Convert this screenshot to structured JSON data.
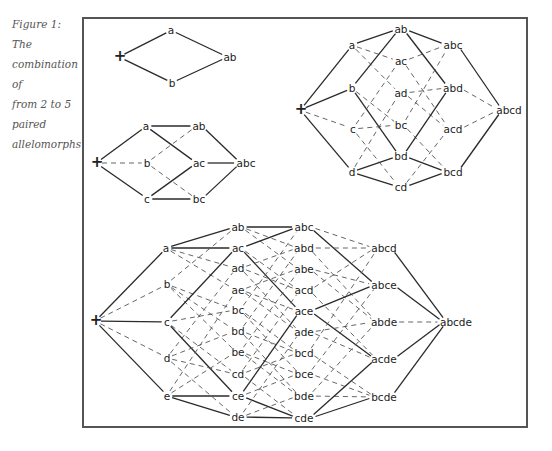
{
  "caption": {
    "line1": "Figure 1: The",
    "line2": "combination of",
    "line3": "from 2 to 5",
    "line4": "paired",
    "line5": "allelomorphs"
  },
  "colors": {
    "frame": "#555555",
    "text": "#222222",
    "caption": "#555555"
  },
  "diagrams": [
    {
      "id": "two-allele",
      "nodes": [
        {
          "id": "+",
          "x": 120,
          "y": 57
        },
        {
          "id": "a",
          "x": 171,
          "y": 30
        },
        {
          "id": "b",
          "x": 172,
          "y": 83
        },
        {
          "id": "ab",
          "x": 230,
          "y": 57
        }
      ],
      "edges": [
        [
          "+",
          "a",
          "s"
        ],
        [
          "+",
          "b",
          "s"
        ],
        [
          "a",
          "ab",
          "s"
        ],
        [
          "b",
          "ab",
          "s"
        ]
      ]
    },
    {
      "id": "three-allele",
      "nodes": [
        {
          "id": "+",
          "x": 97,
          "y": 163
        },
        {
          "id": "a",
          "x": 146,
          "y": 126
        },
        {
          "id": "b",
          "x": 147,
          "y": 163
        },
        {
          "id": "c",
          "x": 147,
          "y": 199
        },
        {
          "id": "ab",
          "x": 199,
          "y": 126
        },
        {
          "id": "ac",
          "x": 199,
          "y": 163
        },
        {
          "id": "bc",
          "x": 199,
          "y": 199
        },
        {
          "id": "abc",
          "x": 246,
          "y": 163
        }
      ],
      "edges": [
        [
          "+",
          "a",
          "s"
        ],
        [
          "+",
          "b",
          "d"
        ],
        [
          "+",
          "c",
          "s"
        ],
        [
          "a",
          "ab",
          "s"
        ],
        [
          "a",
          "ac",
          "s"
        ],
        [
          "b",
          "ab",
          "d"
        ],
        [
          "b",
          "bc",
          "d"
        ],
        [
          "c",
          "ac",
          "s"
        ],
        [
          "c",
          "bc",
          "s"
        ],
        [
          "ab",
          "abc",
          "s"
        ],
        [
          "ac",
          "abc",
          "s"
        ],
        [
          "bc",
          "abc",
          "s"
        ]
      ]
    },
    {
      "id": "four-allele",
      "nodes": [
        {
          "id": "+",
          "x": 301,
          "y": 110
        },
        {
          "id": "a",
          "x": 352,
          "y": 45
        },
        {
          "id": "b",
          "x": 352,
          "y": 88
        },
        {
          "id": "c",
          "x": 353,
          "y": 129
        },
        {
          "id": "d",
          "x": 352,
          "y": 172
        },
        {
          "id": "ab",
          "x": 401,
          "y": 29
        },
        {
          "id": "ac",
          "x": 401,
          "y": 61
        },
        {
          "id": "ad",
          "x": 401,
          "y": 93
        },
        {
          "id": "bc",
          "x": 401,
          "y": 125
        },
        {
          "id": "bd",
          "x": 401,
          "y": 156
        },
        {
          "id": "cd",
          "x": 401,
          "y": 187
        },
        {
          "id": "abc",
          "x": 453,
          "y": 45
        },
        {
          "id": "abd",
          "x": 453,
          "y": 88
        },
        {
          "id": "acd",
          "x": 453,
          "y": 129
        },
        {
          "id": "bcd",
          "x": 453,
          "y": 172
        },
        {
          "id": "abcd",
          "x": 509,
          "y": 110
        }
      ],
      "edges": [
        [
          "+",
          "a",
          "s"
        ],
        [
          "+",
          "b",
          "s"
        ],
        [
          "+",
          "c",
          "d"
        ],
        [
          "+",
          "d",
          "s"
        ],
        [
          "a",
          "ab",
          "s"
        ],
        [
          "a",
          "ac",
          "d"
        ],
        [
          "a",
          "ad",
          "d"
        ],
        [
          "b",
          "ab",
          "s"
        ],
        [
          "b",
          "bc",
          "d"
        ],
        [
          "b",
          "bd",
          "s"
        ],
        [
          "c",
          "ac",
          "d"
        ],
        [
          "c",
          "bc",
          "d"
        ],
        [
          "c",
          "cd",
          "d"
        ],
        [
          "d",
          "ad",
          "d"
        ],
        [
          "d",
          "bd",
          "s"
        ],
        [
          "d",
          "cd",
          "s"
        ],
        [
          "ab",
          "abc",
          "s"
        ],
        [
          "ab",
          "abd",
          "s"
        ],
        [
          "ac",
          "abc",
          "d"
        ],
        [
          "ac",
          "acd",
          "d"
        ],
        [
          "ad",
          "abd",
          "d"
        ],
        [
          "ad",
          "acd",
          "d"
        ],
        [
          "bc",
          "abc",
          "d"
        ],
        [
          "bc",
          "bcd",
          "d"
        ],
        [
          "bd",
          "abd",
          "s"
        ],
        [
          "bd",
          "bcd",
          "s"
        ],
        [
          "cd",
          "acd",
          "d"
        ],
        [
          "cd",
          "bcd",
          "s"
        ],
        [
          "abc",
          "abcd",
          "s"
        ],
        [
          "abd",
          "abcd",
          "d"
        ],
        [
          "acd",
          "abcd",
          "d"
        ],
        [
          "bcd",
          "abcd",
          "s"
        ]
      ]
    },
    {
      "id": "five-allele",
      "nodes": [
        {
          "id": "+",
          "x": 96,
          "y": 321
        },
        {
          "id": "a",
          "x": 166,
          "y": 248
        },
        {
          "id": "b",
          "x": 167,
          "y": 284
        },
        {
          "id": "c",
          "x": 167,
          "y": 322
        },
        {
          "id": "d",
          "x": 167,
          "y": 358
        },
        {
          "id": "e",
          "x": 167,
          "y": 396
        },
        {
          "id": "ab",
          "x": 238,
          "y": 227
        },
        {
          "id": "ac",
          "x": 238,
          "y": 248
        },
        {
          "id": "ad",
          "x": 238,
          "y": 268
        },
        {
          "id": "ae",
          "x": 238,
          "y": 290
        },
        {
          "id": "bc",
          "x": 238,
          "y": 310
        },
        {
          "id": "bd",
          "x": 238,
          "y": 331
        },
        {
          "id": "be",
          "x": 238,
          "y": 352
        },
        {
          "id": "cd",
          "x": 238,
          "y": 374
        },
        {
          "id": "ce",
          "x": 238,
          "y": 396
        },
        {
          "id": "de",
          "x": 238,
          "y": 417
        },
        {
          "id": "abc",
          "x": 304,
          "y": 227
        },
        {
          "id": "abd",
          "x": 304,
          "y": 248
        },
        {
          "id": "abe",
          "x": 304,
          "y": 269
        },
        {
          "id": "acd",
          "x": 304,
          "y": 290
        },
        {
          "id": "ace",
          "x": 304,
          "y": 311
        },
        {
          "id": "ade",
          "x": 304,
          "y": 332
        },
        {
          "id": "bcd",
          "x": 304,
          "y": 353
        },
        {
          "id": "bce",
          "x": 304,
          "y": 374
        },
        {
          "id": "bde",
          "x": 304,
          "y": 396
        },
        {
          "id": "cde",
          "x": 304,
          "y": 418
        },
        {
          "id": "abcd",
          "x": 384,
          "y": 248
        },
        {
          "id": "abce",
          "x": 384,
          "y": 285
        },
        {
          "id": "abde",
          "x": 384,
          "y": 322
        },
        {
          "id": "acde",
          "x": 384,
          "y": 359
        },
        {
          "id": "bcde",
          "x": 384,
          "y": 397
        },
        {
          "id": "abcde",
          "x": 456,
          "y": 322
        }
      ],
      "edges": [
        [
          "+",
          "a",
          "s"
        ],
        [
          "+",
          "b",
          "d"
        ],
        [
          "+",
          "c",
          "s"
        ],
        [
          "+",
          "d",
          "d"
        ],
        [
          "+",
          "e",
          "s"
        ],
        [
          "a",
          "ab",
          "s"
        ],
        [
          "a",
          "ac",
          "s"
        ],
        [
          "a",
          "ad",
          "d"
        ],
        [
          "a",
          "ae",
          "d"
        ],
        [
          "b",
          "ab",
          "d"
        ],
        [
          "b",
          "bc",
          "d"
        ],
        [
          "b",
          "bd",
          "d"
        ],
        [
          "b",
          "be",
          "d"
        ],
        [
          "c",
          "ac",
          "s"
        ],
        [
          "c",
          "bc",
          "d"
        ],
        [
          "c",
          "cd",
          "d"
        ],
        [
          "c",
          "ce",
          "s"
        ],
        [
          "d",
          "ad",
          "d"
        ],
        [
          "d",
          "bd",
          "d"
        ],
        [
          "d",
          "cd",
          "d"
        ],
        [
          "d",
          "de",
          "d"
        ],
        [
          "e",
          "ae",
          "d"
        ],
        [
          "e",
          "be",
          "d"
        ],
        [
          "e",
          "ce",
          "s"
        ],
        [
          "e",
          "de",
          "s"
        ],
        [
          "ab",
          "abc",
          "s"
        ],
        [
          "ab",
          "abd",
          "d"
        ],
        [
          "ab",
          "abe",
          "d"
        ],
        [
          "ac",
          "abc",
          "s"
        ],
        [
          "ac",
          "acd",
          "d"
        ],
        [
          "ac",
          "ace",
          "s"
        ],
        [
          "ad",
          "abd",
          "d"
        ],
        [
          "ad",
          "acd",
          "d"
        ],
        [
          "ad",
          "ade",
          "d"
        ],
        [
          "ae",
          "abe",
          "d"
        ],
        [
          "ae",
          "ace",
          "d"
        ],
        [
          "ae",
          "ade",
          "d"
        ],
        [
          "bc",
          "abc",
          "d"
        ],
        [
          "bc",
          "bcd",
          "d"
        ],
        [
          "bc",
          "bce",
          "d"
        ],
        [
          "bd",
          "abd",
          "d"
        ],
        [
          "bd",
          "bcd",
          "d"
        ],
        [
          "bd",
          "bde",
          "d"
        ],
        [
          "be",
          "abe",
          "d"
        ],
        [
          "be",
          "bce",
          "d"
        ],
        [
          "be",
          "bde",
          "d"
        ],
        [
          "cd",
          "acd",
          "d"
        ],
        [
          "cd",
          "bcd",
          "d"
        ],
        [
          "cd",
          "cde",
          "d"
        ],
        [
          "ce",
          "ace",
          "s"
        ],
        [
          "ce",
          "bce",
          "d"
        ],
        [
          "ce",
          "cde",
          "s"
        ],
        [
          "de",
          "ade",
          "d"
        ],
        [
          "de",
          "bde",
          "d"
        ],
        [
          "de",
          "cde",
          "s"
        ],
        [
          "abc",
          "abcd",
          "d"
        ],
        [
          "abc",
          "abce",
          "s"
        ],
        [
          "abd",
          "abcd",
          "d"
        ],
        [
          "abd",
          "abde",
          "d"
        ],
        [
          "abe",
          "abce",
          "d"
        ],
        [
          "abe",
          "abde",
          "d"
        ],
        [
          "acd",
          "abcd",
          "d"
        ],
        [
          "acd",
          "acde",
          "d"
        ],
        [
          "ace",
          "abce",
          "s"
        ],
        [
          "ace",
          "acde",
          "s"
        ],
        [
          "ade",
          "abde",
          "d"
        ],
        [
          "ade",
          "acde",
          "d"
        ],
        [
          "bcd",
          "abcd",
          "d"
        ],
        [
          "bcd",
          "bcde",
          "d"
        ],
        [
          "bce",
          "abce",
          "d"
        ],
        [
          "bce",
          "bcde",
          "d"
        ],
        [
          "bde",
          "abde",
          "d"
        ],
        [
          "bde",
          "bcde",
          "d"
        ],
        [
          "cde",
          "acde",
          "s"
        ],
        [
          "cde",
          "bcde",
          "s"
        ],
        [
          "abcd",
          "abcde",
          "s"
        ],
        [
          "abce",
          "abcde",
          "s"
        ],
        [
          "abde",
          "abcde",
          "d"
        ],
        [
          "acde",
          "abcde",
          "s"
        ],
        [
          "bcde",
          "abcde",
          "s"
        ]
      ]
    }
  ]
}
